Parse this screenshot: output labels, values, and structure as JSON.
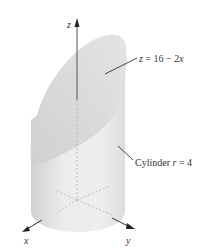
{
  "figure": {
    "axes": {
      "x_label": "x",
      "y_label": "y",
      "z_label": "z"
    },
    "annotations": {
      "plane": {
        "var": "z",
        "eq": " = 16 − 2",
        "var2": "x"
      },
      "cylinder": {
        "prefix": "Cylinder ",
        "var": "r",
        "suffix": " = 4"
      }
    },
    "colors": {
      "cylinder_fill": "#e6e6e6",
      "plane_fill": "#d9d9d9",
      "axis": "#444444",
      "dash": "#b0b0b0",
      "text": "#333333"
    }
  }
}
